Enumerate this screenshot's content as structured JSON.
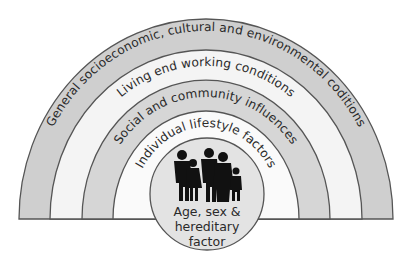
{
  "diagram": {
    "type": "layered rainbow model of health determinants",
    "rings": [
      {
        "label": "General socioeconomic, cultural and environmental coditions",
        "fill": "#cfcfcf"
      },
      {
        "label": "Living end working conditions",
        "fill": "#f4f4f4"
      },
      {
        "label": "Social and community influences",
        "fill": "#d6d6d6"
      },
      {
        "label": "Individual lifestyle factors",
        "fill": "#fafafa"
      }
    ],
    "core": {
      "line1": "Age, sex &",
      "line2": "hereditary",
      "line3": "factor",
      "fill": "#e3e3e3",
      "icon": "family-silhouette-icon"
    },
    "stroke_color": "#555555"
  }
}
